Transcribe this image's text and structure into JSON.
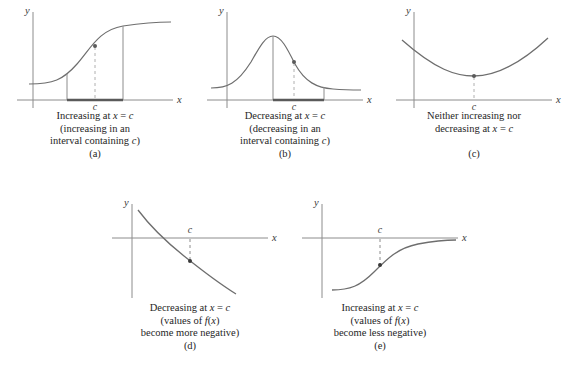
{
  "figure": {
    "background": "#ffffff",
    "axis_color": "#8c8c8c",
    "curve_color": "#6e6e6e",
    "interval_color": "#5a5a5a",
    "dash_color": "#b0b0b0",
    "text_color": "#262626"
  },
  "panels": [
    {
      "id": "a",
      "letter": "(a)",
      "axis_x_label": "x",
      "axis_y_label": "y",
      "point_label": "c",
      "curve_type": "sigmoid-increasing",
      "has_interval_bar": true,
      "caption_lines": [
        {
          "parts": [
            {
              "t": "Increasing at ",
              "m": false
            },
            {
              "t": "x",
              "m": true
            },
            {
              "t": " = ",
              "m": false
            },
            {
              "t": "c",
              "m": true
            }
          ]
        },
        {
          "parts": [
            {
              "t": "(increasing in an",
              "m": false
            }
          ]
        },
        {
          "parts": [
            {
              "t": "interval containing ",
              "m": false
            },
            {
              "t": "c",
              "m": true
            },
            {
              "t": ")",
              "m": false
            }
          ]
        }
      ]
    },
    {
      "id": "b",
      "letter": "(b)",
      "axis_x_label": "x",
      "axis_y_label": "y",
      "point_label": "c",
      "curve_type": "bell-decreasing",
      "has_interval_bar": true,
      "caption_lines": [
        {
          "parts": [
            {
              "t": "Decreasing at ",
              "m": false
            },
            {
              "t": "x",
              "m": true
            },
            {
              "t": " = ",
              "m": false
            },
            {
              "t": "c",
              "m": true
            }
          ]
        },
        {
          "parts": [
            {
              "t": "(decreasing in an",
              "m": false
            }
          ]
        },
        {
          "parts": [
            {
              "t": "interval containing ",
              "m": false
            },
            {
              "t": "c",
              "m": true
            },
            {
              "t": ")",
              "m": false
            }
          ]
        }
      ]
    },
    {
      "id": "c",
      "letter": "(c)",
      "axis_x_label": "x",
      "axis_y_label": "y",
      "point_label": "c",
      "curve_type": "parabola-minimum",
      "has_interval_bar": false,
      "caption_lines": [
        {
          "parts": [
            {
              "t": "Neither increasing nor",
              "m": false
            }
          ]
        },
        {
          "parts": [
            {
              "t": "decreasing at ",
              "m": false
            },
            {
              "t": "x",
              "m": true
            },
            {
              "t": " = ",
              "m": false
            },
            {
              "t": "c",
              "m": true
            }
          ]
        }
      ]
    },
    {
      "id": "d",
      "letter": "(d)",
      "axis_x_label": "x",
      "axis_y_label": "y",
      "point_label": "c",
      "curve_type": "decay-decreasing-crossing",
      "has_interval_bar": false,
      "caption_lines": [
        {
          "parts": [
            {
              "t": "Decreasing at ",
              "m": false
            },
            {
              "t": "x",
              "m": true
            },
            {
              "t": " = ",
              "m": false
            },
            {
              "t": "c",
              "m": true
            }
          ]
        },
        {
          "parts": [
            {
              "t": "(values of ",
              "m": false
            },
            {
              "t": "f",
              "m": true
            },
            {
              "t": "(",
              "m": false
            },
            {
              "t": "x",
              "m": true
            },
            {
              "t": ")",
              "m": false
            }
          ]
        },
        {
          "parts": [
            {
              "t": "become more negative)",
              "m": false
            }
          ]
        }
      ]
    },
    {
      "id": "e",
      "letter": "(e)",
      "axis_x_label": "x",
      "axis_y_label": "y",
      "point_label": "c",
      "curve_type": "sigmoid-below-axis",
      "has_interval_bar": false,
      "caption_lines": [
        {
          "parts": [
            {
              "t": "Increasing at ",
              "m": false
            },
            {
              "t": "x",
              "m": true
            },
            {
              "t": " = ",
              "m": false
            },
            {
              "t": "c",
              "m": true
            }
          ]
        },
        {
          "parts": [
            {
              "t": "(values of ",
              "m": false
            },
            {
              "t": "f",
              "m": true
            },
            {
              "t": "(",
              "m": false
            },
            {
              "t": "x",
              "m": true
            },
            {
              "t": ")",
              "m": false
            }
          ]
        },
        {
          "parts": [
            {
              "t": "become less negative)",
              "m": false
            }
          ]
        }
      ]
    }
  ],
  "chart_data": {
    "type": "line",
    "xlabel": "x",
    "ylabel": "y",
    "grid": false,
    "legend": "none",
    "subplots": [
      {
        "name": "(a)",
        "curve": "sigmoid increasing",
        "behavior_at_c": "increasing",
        "point_c_on_curve": true,
        "interval_marked_on_x_axis": true,
        "x": [
          -4,
          -3,
          -2,
          -1,
          0,
          1,
          2,
          3,
          4
        ],
        "y": [
          0.02,
          0.05,
          0.12,
          0.27,
          0.5,
          0.73,
          0.88,
          0.95,
          0.98
        ]
      },
      {
        "name": "(b)",
        "curve": "bell curve, decreasing branch marked",
        "behavior_at_c": "decreasing",
        "point_c_on_curve": true,
        "interval_marked_on_x_axis": true,
        "x": [
          -4,
          -3,
          -2,
          -1,
          0,
          1,
          2,
          3,
          4
        ],
        "y": [
          0.02,
          0.1,
          0.32,
          0.73,
          1.0,
          0.73,
          0.32,
          0.1,
          0.02
        ]
      },
      {
        "name": "(c)",
        "curve": "upward parabola with minimum at c",
        "behavior_at_c": "neither increasing nor decreasing",
        "point_c_on_curve": true,
        "interval_marked_on_x_axis": false,
        "x": [
          -4,
          -3,
          -2,
          -1,
          0,
          1,
          2,
          3,
          4
        ],
        "y": [
          1.0,
          0.56,
          0.25,
          0.06,
          0.0,
          0.06,
          0.25,
          0.56,
          1.0
        ]
      },
      {
        "name": "(d)",
        "curve": "decaying curve crossing the x-axis, values become more negative",
        "behavior_at_c": "decreasing",
        "point_c_on_curve": true,
        "interval_marked_on_x_axis": false,
        "x": [
          -4,
          -3,
          -2,
          -1,
          0,
          1,
          2,
          3,
          4
        ],
        "y": [
          1.6,
          1.1,
          0.65,
          0.25,
          -0.1,
          -0.42,
          -0.7,
          -0.95,
          -1.18
        ]
      },
      {
        "name": "(e)",
        "curve": "sigmoid below the x-axis rising toward it, values become less negative",
        "behavior_at_c": "increasing",
        "point_c_on_curve": true,
        "interval_marked_on_x_axis": false,
        "x": [
          -4,
          -3,
          -2,
          -1,
          0,
          1,
          2,
          3,
          4
        ],
        "y": [
          -1.0,
          -0.96,
          -0.85,
          -0.6,
          -0.35,
          -0.16,
          -0.06,
          -0.02,
          -0.01
        ]
      }
    ]
  }
}
